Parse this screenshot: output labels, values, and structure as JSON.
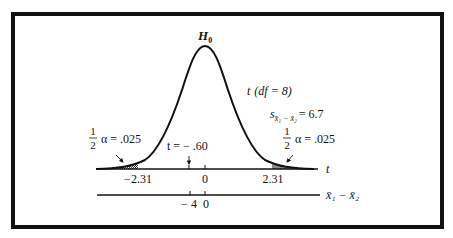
{
  "figure": {
    "null_label": "H",
    "null_subscript": "0",
    "dist_label_t": "t",
    "dist_label_df": "(df = 8)",
    "se_label_s": "s",
    "se_label_sub": "x̄₁ − x̄₂",
    "se_label_value": "= 6.7",
    "left_tail": {
      "frac_num": "1",
      "frac_den": "2",
      "text": "α = .025"
    },
    "right_tail": {
      "frac_num": "1",
      "frac_den": "2",
      "text": "α = .025"
    },
    "observed_label": "t = − .60",
    "t_axis": {
      "name": "t",
      "ticks": [
        "−2.31",
        "0",
        "2.31"
      ]
    },
    "diff_axis": {
      "name": "x̄₁ − x̄₂",
      "ticks": [
        "− 4",
        "0"
      ]
    }
  },
  "colors": {
    "ink": "#111111",
    "background": "#ffffff",
    "shading": "#777777"
  }
}
